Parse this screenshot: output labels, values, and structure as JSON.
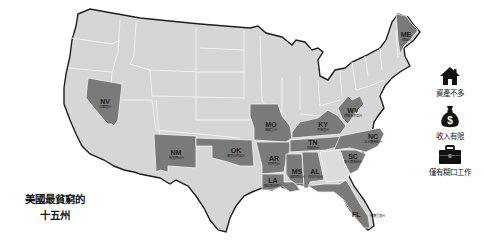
{
  "title": {
    "line1": "美國最貧窮的",
    "line2": "十五州"
  },
  "colors": {
    "background": "#ffffff",
    "normal_state": "#d6d6d6",
    "highlighted_state": "#7a7a7a",
    "border": "#1e1e1e",
    "state_lines": "#f2f2f2",
    "text": "#1a1a1a"
  },
  "states": [
    {
      "abbr": "NV",
      "name": "內華達州"
    },
    {
      "abbr": "NM",
      "name": "新墨西哥州"
    },
    {
      "abbr": "OK",
      "name": "奧克拉荷馬州"
    },
    {
      "abbr": "MO",
      "name": "密蘇里州"
    },
    {
      "abbr": "AR",
      "name": "阿肯色州"
    },
    {
      "abbr": "LA",
      "name": "路易斯安那州"
    },
    {
      "abbr": "MS",
      "name": "密西西比州"
    },
    {
      "abbr": "AL",
      "name": "阿拉巴馬州"
    },
    {
      "abbr": "TN",
      "name": "田納西州"
    },
    {
      "abbr": "KY",
      "name": "肯塔基州"
    },
    {
      "abbr": "WV",
      "name": "西維吉尼亞州"
    },
    {
      "abbr": "NC",
      "name": "北卡羅來納州"
    },
    {
      "abbr": "SC",
      "name": "南卡羅來納州"
    },
    {
      "abbr": "FL",
      "name": "佛羅里達州"
    },
    {
      "abbr": "ME",
      "name": "緬因州"
    }
  ],
  "legend": [
    {
      "icon": "house-icon",
      "label": "資產不多"
    },
    {
      "icon": "money-bag-icon",
      "label": "收入有限"
    },
    {
      "icon": "briefcase-icon",
      "label": "僅有糊口工作"
    }
  ]
}
